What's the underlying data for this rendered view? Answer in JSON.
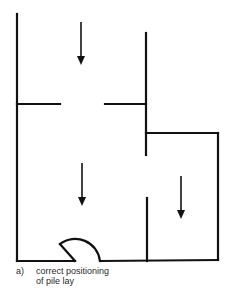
{
  "diagram": {
    "type": "floor-plan",
    "stroke_color": "#111111",
    "background": "#ffffff",
    "rooms": [
      {
        "name": "upper-left-area",
        "arrow": "down"
      },
      {
        "name": "lower-left-room",
        "arrow": "down"
      },
      {
        "name": "right-room",
        "arrow": "down"
      }
    ],
    "arrows": [
      {
        "direction": "down",
        "meaning": "pile lay direction"
      },
      {
        "direction": "down",
        "meaning": "pile lay direction"
      },
      {
        "direction": "down",
        "meaning": "pile lay direction"
      }
    ],
    "door": {
      "position": "bottom wall",
      "swing": "inward arc"
    }
  },
  "caption": {
    "label": "a)",
    "line1": "correct positioning",
    "line2": "of pile lay"
  }
}
